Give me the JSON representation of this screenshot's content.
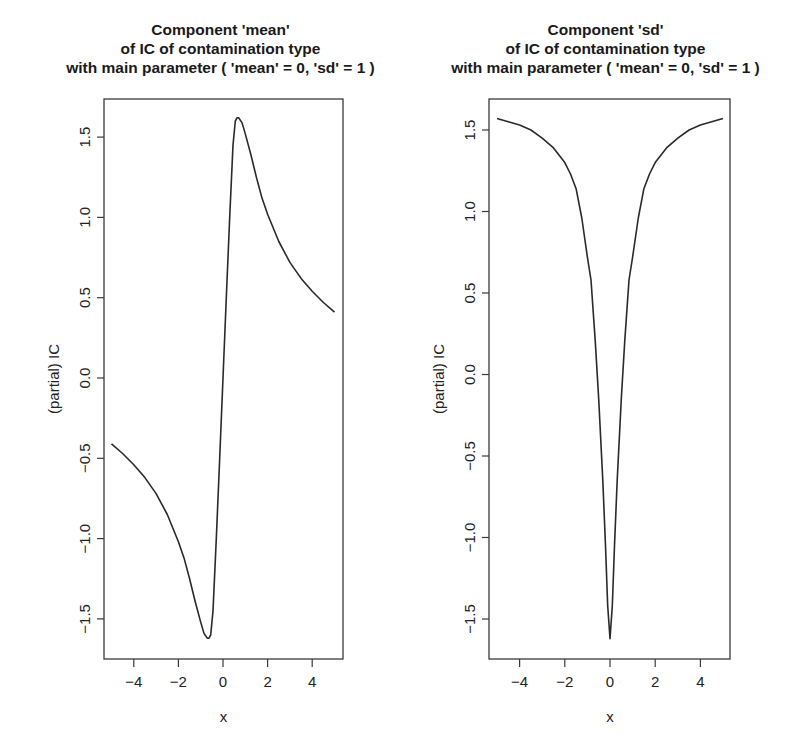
{
  "chart_data": [
    {
      "type": "line",
      "title": "Component  'mean'\nof IC of contamination type\nwith main parameter ( 'mean' = 0, 'sd' = 1 )",
      "title_lines": [
        "Component  'mean'",
        "of IC of contamination type",
        "with main parameter ( 'mean' = 0, 'sd' = 1 )"
      ],
      "xlabel": "x",
      "ylabel": "(partial) IC",
      "xlim": [
        -5.4,
        5.4
      ],
      "ylim": [
        -1.75,
        1.75
      ],
      "xticks": [
        -4,
        -2,
        0,
        2,
        4
      ],
      "xtick_labels": [
        "−4",
        "−2",
        "0",
        "2",
        "4"
      ],
      "yticks": [
        -1.5,
        -1.0,
        -0.5,
        0.0,
        0.5,
        1.0,
        1.5
      ],
      "ytick_labels": [
        "−1.5",
        "−1.0",
        "−0.5",
        "0.0",
        "0.5",
        "1.0",
        "1.5"
      ],
      "grid": false,
      "legend": null,
      "series": [
        {
          "name": "IC mean component",
          "x": [
            -5.0,
            -4.5,
            -4.0,
            -3.5,
            -3.0,
            -2.5,
            -2.0,
            -1.75,
            -1.5,
            -1.25,
            -1.0,
            -0.85,
            -0.7,
            -0.63,
            -0.55,
            -0.45,
            -0.3,
            -0.15,
            0.0,
            0.15,
            0.3,
            0.45,
            0.55,
            0.63,
            0.7,
            0.85,
            1.0,
            1.25,
            1.5,
            1.75,
            2.0,
            2.5,
            3.0,
            3.5,
            4.0,
            4.5,
            5.0
          ],
          "values": [
            -0.41,
            -0.47,
            -0.54,
            -0.62,
            -0.72,
            -0.85,
            -1.02,
            -1.12,
            -1.25,
            -1.39,
            -1.52,
            -1.59,
            -1.62,
            -1.62,
            -1.6,
            -1.45,
            -1.0,
            -0.5,
            0.0,
            0.5,
            1.0,
            1.45,
            1.6,
            1.62,
            1.62,
            1.59,
            1.52,
            1.39,
            1.25,
            1.12,
            1.02,
            0.85,
            0.72,
            0.62,
            0.54,
            0.47,
            0.41
          ]
        }
      ]
    },
    {
      "type": "line",
      "title": "Component  'sd'\nof IC of contamination type\nwith main parameter ( 'mean' = 0, 'sd' = 1 )",
      "title_lines": [
        "Component  'sd'",
        "of IC of contamination type",
        "with main parameter ( 'mean' = 0, 'sd' = 1 )"
      ],
      "xlabel": "x",
      "ylabel": "(partial) IC",
      "xlim": [
        -5.4,
        5.4
      ],
      "ylim": [
        -1.75,
        1.75
      ],
      "xticks": [
        -4,
        -2,
        0,
        2,
        4
      ],
      "xtick_labels": [
        "−4",
        "−2",
        "0",
        "2",
        "4"
      ],
      "yticks": [
        -1.5,
        -1.0,
        -0.5,
        0.0,
        0.5,
        1.0,
        1.5
      ],
      "ytick_labels": [
        "−1.5",
        "−1.0",
        "−0.5",
        "0.0",
        "0.5",
        "1.0",
        "1.5"
      ],
      "grid": false,
      "legend": null,
      "series": [
        {
          "name": "IC sd component",
          "x": [
            -5.0,
            -4.5,
            -4.0,
            -3.5,
            -3.0,
            -2.5,
            -2.0,
            -1.75,
            -1.5,
            -1.25,
            -1.0,
            -0.84,
            -0.65,
            -0.5,
            -0.32,
            -0.2,
            -0.1,
            0.0,
            0.1,
            0.2,
            0.32,
            0.5,
            0.65,
            0.84,
            1.0,
            1.25,
            1.5,
            1.75,
            2.0,
            2.5,
            3.0,
            3.5,
            4.0,
            4.5,
            5.0
          ],
          "values": [
            1.57,
            1.55,
            1.53,
            1.5,
            1.45,
            1.39,
            1.3,
            1.23,
            1.14,
            0.96,
            0.72,
            0.58,
            0.2,
            -0.15,
            -0.65,
            -1.05,
            -1.42,
            -1.62,
            -1.42,
            -1.05,
            -0.65,
            -0.15,
            0.2,
            0.58,
            0.72,
            0.96,
            1.14,
            1.23,
            1.3,
            1.39,
            1.45,
            1.5,
            1.53,
            1.55,
            1.57
          ]
        }
      ]
    }
  ],
  "panels": [
    {
      "title_line1": "Component  'mean'",
      "title_line2": "of IC of contamination type",
      "title_line3": "with main parameter ( 'mean' = 0, 'sd' = 1 )",
      "xlabel": "x",
      "ylabel": "(partial) IC"
    },
    {
      "title_line1": "Component  'sd'",
      "title_line2": "of IC of contamination type",
      "title_line3": "with main parameter ( 'mean' = 0, 'sd' = 1 )",
      "xlabel": "x",
      "ylabel": "(partial) IC"
    }
  ],
  "style": {
    "line_color": "#2a2a2a",
    "axis_color": "#3a3a3a",
    "background": "#ffffff"
  }
}
